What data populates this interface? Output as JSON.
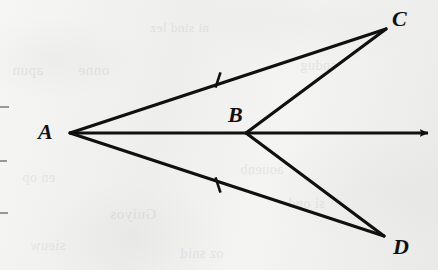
{
  "figure": {
    "type": "geometry-diagram",
    "background_color": "#f2f2f1",
    "ink_color": "#101010",
    "width": 438,
    "height": 270
  },
  "points": [
    {
      "id": "A",
      "label": "A",
      "x": 70,
      "y": 133,
      "label_x": 38,
      "label_y": 121
    },
    {
      "id": "B",
      "label": "B",
      "x": 246,
      "y": 133,
      "label_x": 228,
      "label_y": 104
    },
    {
      "id": "C",
      "label": "C",
      "x": 386,
      "y": 29,
      "label_x": 392,
      "label_y": 8
    },
    {
      "id": "D",
      "label": "D",
      "x": 384,
      "y": 236,
      "label_x": 393,
      "label_y": 236
    }
  ],
  "segments": [
    {
      "id": "AC",
      "name": "segment-ac",
      "from": "A",
      "to": "C",
      "x1": 70,
      "y1": 133,
      "x2": 386,
      "y2": 29
    },
    {
      "id": "AD",
      "name": "segment-ad",
      "from": "A",
      "to": "D",
      "x1": 70,
      "y1": 133,
      "x2": 384,
      "y2": 236
    },
    {
      "id": "BC",
      "name": "segment-bc",
      "from": "B",
      "to": "C",
      "x1": 246,
      "y1": 133,
      "x2": 386,
      "y2": 29
    },
    {
      "id": "BD",
      "name": "segment-bd",
      "from": "B",
      "to": "D",
      "x1": 246,
      "y1": 133,
      "x2": 384,
      "y2": 236
    }
  ],
  "rays": [
    {
      "id": "AB",
      "name": "ray-ab",
      "from": "A",
      "through": "B",
      "x1": 70,
      "y1": 133,
      "x2": 428,
      "y2": 133,
      "arrowhead": "end"
    }
  ],
  "tick_marks": [
    {
      "id": "tick-ac",
      "on_segment": "AC",
      "x": 218,
      "y": 80,
      "count": 1,
      "angle_deg": -18
    },
    {
      "id": "tick-ad",
      "on_segment": "AD",
      "x": 218,
      "y": 185,
      "count": 1,
      "angle_deg": 18
    }
  ],
  "bleed_text": [
    {
      "text": "apun",
      "x": 12,
      "y": 62,
      "size": 15
    },
    {
      "text": "onne",
      "x": 78,
      "y": 62,
      "size": 15
    },
    {
      "text": "ni sind lez",
      "x": 150,
      "y": 20,
      "size": 13
    },
    {
      "text": "sndug",
      "x": 300,
      "y": 58,
      "size": 14
    },
    {
      "text": "en op",
      "x": 22,
      "y": 170,
      "size": 14
    },
    {
      "text": "Guiyos",
      "x": 110,
      "y": 206,
      "size": 15
    },
    {
      "text": "aouenb",
      "x": 240,
      "y": 162,
      "size": 14
    },
    {
      "text": "si ond",
      "x": 288,
      "y": 196,
      "size": 14
    },
    {
      "text": "sieuw",
      "x": 30,
      "y": 238,
      "size": 14
    },
    {
      "text": "oz snid",
      "x": 180,
      "y": 246,
      "size": 14
    }
  ]
}
